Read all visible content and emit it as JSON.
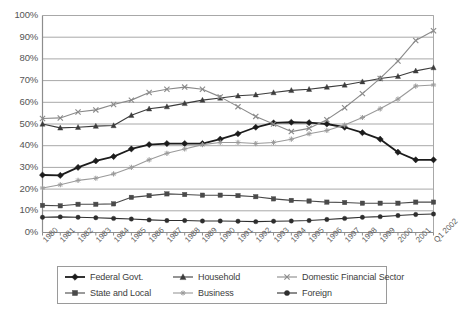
{
  "chart_data": {
    "type": "line",
    "title": "",
    "subtitle": "",
    "xlabel": "",
    "ylabel": "",
    "ylim": [
      0,
      100
    ],
    "ytick_labels": [
      "100%",
      "90%",
      "80%",
      "70%",
      "60%",
      "50%",
      "40%",
      "30%",
      "20%",
      "10%",
      "0%"
    ],
    "ytick_values": [
      100,
      90,
      80,
      70,
      60,
      50,
      40,
      30,
      20,
      10,
      0
    ],
    "grid": "horizontal",
    "legend_position": "bottom",
    "categories": [
      "1980",
      "1981",
      "1982",
      "1983",
      "1984",
      "1985",
      "1986",
      "1987",
      "1988",
      "1989",
      "1990",
      "1991",
      "1992",
      "1993",
      "1994",
      "1995",
      "1996",
      "1997",
      "1998",
      "1999",
      "2000",
      "2001",
      "Q1 2002"
    ],
    "series": [
      {
        "name": "Federal Govt.",
        "marker": "diamond",
        "color": "#1c1c1c",
        "width": 1.8,
        "values": [
          26.5,
          26.3,
          30.0,
          33.0,
          35.0,
          38.5,
          40.5,
          41.0,
          41.0,
          41.0,
          43.0,
          45.5,
          48.5,
          50.5,
          50.8,
          50.6,
          50.0,
          48.5,
          46.0,
          43.0,
          37.0,
          33.5,
          33.5
        ]
      },
      {
        "name": "Household",
        "marker": "triangle",
        "color": "#3c3c3c",
        "width": 1.1,
        "values": [
          50.0,
          48.2,
          48.5,
          49.0,
          49.3,
          54.0,
          57.0,
          58.0,
          59.5,
          61.0,
          62.0,
          63.0,
          63.5,
          64.5,
          65.5,
          66.0,
          67.0,
          68.0,
          69.5,
          71.0,
          72.0,
          74.5,
          76.0
        ]
      },
      {
        "name": "Domestic Financial Sector",
        "marker": "x",
        "color": "#8a8a8a",
        "width": 1.1,
        "values": [
          52.5,
          52.8,
          55.5,
          56.5,
          59.0,
          61.0,
          64.5,
          66.0,
          67.0,
          66.0,
          62.5,
          58.0,
          53.5,
          50.0,
          46.5,
          48.0,
          52.0,
          57.5,
          64.0,
          71.0,
          79.0,
          88.5,
          93.0
        ]
      },
      {
        "name": "State and Local",
        "marker": "square",
        "color": "#4a4a4a",
        "width": 1.1,
        "values": [
          12.5,
          12.3,
          13.0,
          13.0,
          13.2,
          16.2,
          17.0,
          17.8,
          17.5,
          17.2,
          17.2,
          17.0,
          16.5,
          15.5,
          14.8,
          14.5,
          14.0,
          13.8,
          13.5,
          13.5,
          13.5,
          14.0,
          14.0
        ]
      },
      {
        "name": "Business",
        "marker": "asterisk",
        "color": "#9a9a9a",
        "width": 1.1,
        "values": [
          20.5,
          22.0,
          24.0,
          25.0,
          27.0,
          30.0,
          33.5,
          36.5,
          38.5,
          40.5,
          41.5,
          41.5,
          41.0,
          41.5,
          43.0,
          45.5,
          47.0,
          49.5,
          53.0,
          57.0,
          61.5,
          67.5,
          68.0
        ]
      },
      {
        "name": "Foreign",
        "marker": "circle",
        "color": "#2e2e2e",
        "width": 1.1,
        "values": [
          7.0,
          7.2,
          7.0,
          6.8,
          6.5,
          6.2,
          5.8,
          5.5,
          5.5,
          5.3,
          5.3,
          5.2,
          5.0,
          5.2,
          5.3,
          5.5,
          6.0,
          6.5,
          7.0,
          7.3,
          7.8,
          8.3,
          8.5
        ]
      }
    ]
  },
  "legend": {
    "entries": [
      {
        "label": "Federal Govt."
      },
      {
        "label": "Household"
      },
      {
        "label": "Domestic Financial Sector"
      },
      {
        "label": "State and Local"
      },
      {
        "label": "Business"
      },
      {
        "label": "Foreign"
      }
    ]
  }
}
